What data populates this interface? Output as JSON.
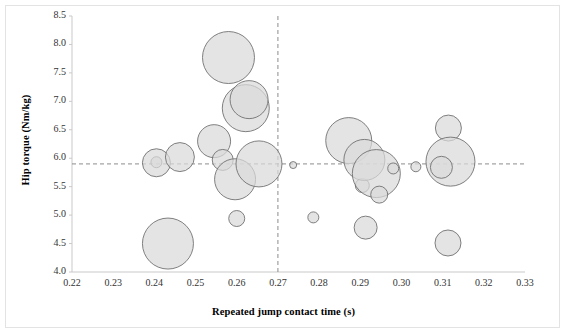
{
  "chart_data": {
    "type": "scatter",
    "title": "",
    "xlabel": "Repeated jump contact time (s)",
    "ylabel": "Hip torque (Nm/kg)",
    "xlim": [
      0.22,
      0.33
    ],
    "ylim": [
      4.0,
      8.5
    ],
    "xticks": [
      "0.22",
      "0.23",
      "0.24",
      "0.25",
      "0.26",
      "0.27",
      "0.28",
      "0.29",
      "0.30",
      "0.31",
      "0.32",
      "0.33"
    ],
    "yticks": [
      "4.0",
      "4.5",
      "5.0",
      "5.5",
      "6.0",
      "6.5",
      "7.0",
      "7.5",
      "8.0",
      "8.5"
    ],
    "grid": false,
    "legend": false,
    "marker_style": "bubble",
    "bubble_fill": "#d9d9d9",
    "bubble_stroke": "#6b6b6b",
    "bubble_opacity": 0.72,
    "reference_lines": [
      {
        "orientation": "vertical",
        "value": 0.27,
        "style": "dashed",
        "color": "#8c8c8c"
      },
      {
        "orientation": "horizontal",
        "value": 5.9,
        "style": "dashed",
        "color": "#8c8c8c"
      }
    ],
    "size_encoding": "bubble radius encodes a third variable",
    "points": [
      {
        "x": 0.2405,
        "y": 5.93,
        "r": 5.5
      },
      {
        "x": 0.2405,
        "y": 5.92,
        "r": 14.0
      },
      {
        "x": 0.2433,
        "y": 4.5,
        "r": 25.5
      },
      {
        "x": 0.2462,
        "y": 6.02,
        "r": 14.5
      },
      {
        "x": 0.2545,
        "y": 6.3,
        "r": 16.5
      },
      {
        "x": 0.2566,
        "y": 5.97,
        "r": 10.5
      },
      {
        "x": 0.258,
        "y": 7.77,
        "r": 26.0
      },
      {
        "x": 0.2596,
        "y": 5.63,
        "r": 20.5
      },
      {
        "x": 0.26,
        "y": 4.94,
        "r": 8.0
      },
      {
        "x": 0.2622,
        "y": 6.88,
        "r": 23.5
      },
      {
        "x": 0.263,
        "y": 7.03,
        "r": 19.0
      },
      {
        "x": 0.2654,
        "y": 5.9,
        "r": 23.0
      },
      {
        "x": 0.2737,
        "y": 5.88,
        "r": 3.5
      },
      {
        "x": 0.2786,
        "y": 4.96,
        "r": 5.5
      },
      {
        "x": 0.2872,
        "y": 6.31,
        "r": 23.0
      },
      {
        "x": 0.2905,
        "y": 5.52,
        "r": 7.0
      },
      {
        "x": 0.291,
        "y": 5.97,
        "r": 20.5
      },
      {
        "x": 0.2913,
        "y": 4.78,
        "r": 11.5
      },
      {
        "x": 0.2939,
        "y": 5.73,
        "r": 24.0
      },
      {
        "x": 0.2946,
        "y": 5.36,
        "r": 8.5
      },
      {
        "x": 0.298,
        "y": 5.82,
        "r": 5.5
      },
      {
        "x": 0.3035,
        "y": 5.85,
        "r": 5.0
      },
      {
        "x": 0.3114,
        "y": 6.53,
        "r": 13.0
      },
      {
        "x": 0.3119,
        "y": 5.94,
        "r": 24.5
      },
      {
        "x": 0.3097,
        "y": 5.84,
        "r": 11.0
      },
      {
        "x": 0.3113,
        "y": 4.51,
        "r": 13.0
      }
    ]
  },
  "plot_geometry": {
    "left_px": 72,
    "right_px": 525,
    "top_px": 16,
    "bottom_px": 272
  }
}
